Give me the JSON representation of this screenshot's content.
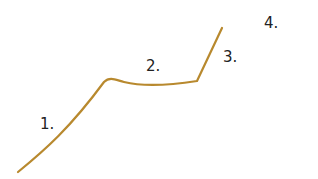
{
  "diagram": {
    "line_color": "#b8892e",
    "labels": [
      {
        "text": "1.",
        "x": 40,
        "y": 117
      },
      {
        "text": "2.",
        "x": 146,
        "y": 59
      },
      {
        "text": "3.",
        "x": 223,
        "y": 50
      },
      {
        "text": "4.",
        "x": 264,
        "y": 16
      }
    ]
  }
}
